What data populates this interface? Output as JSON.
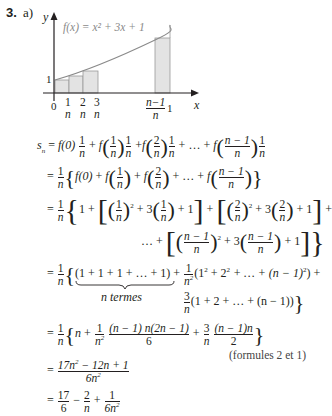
{
  "problem": {
    "number": "3.",
    "part": "a)"
  },
  "graph": {
    "function_label": "f(x) = x² + 3x + 1",
    "y_axis_label": "y",
    "x_axis_label": "x",
    "y_tick": "1",
    "origin_label": "0",
    "x_ticks": [
      {
        "num": "1",
        "den": "n"
      },
      {
        "num": "2",
        "den": "n"
      },
      {
        "num": "3",
        "den": "n"
      },
      {
        "num": "n−1",
        "den": "n"
      }
    ],
    "x_end_label": "1",
    "colors": {
      "curve": "#8a8a8a",
      "rect_fill": "#e3e3e3",
      "rect_stroke": "#9a9a9a",
      "axis": "#231f20"
    }
  },
  "derivation": {
    "lines": [
      {
        "id": "l1",
        "lhs": "s",
        "lhs_sub": "n",
        "text": "= f(0) 1/n + f(1/n) 1/n + f(2/n) 1/n + … + f((n − 1)/n) 1/n"
      },
      {
        "id": "l2",
        "text": "= 1/n { f(0) + f(1/n) + f(2/n) + … + f((n − 1)/n) }"
      },
      {
        "id": "l3",
        "text": "= 1/n { 1 + [ (1/n)² + 3 (1/n) + 1 ] + [ (2/n)² + 3 (2/n) + 1 ] +"
      },
      {
        "id": "l4",
        "text": "… + [ ((n − 1)/n)² + 3 ((n − 1)/n) + 1 ] }"
      },
      {
        "id": "l5",
        "text": "= 1/n { (1 + 1 + 1 + … + 1) + 1/n² (1² + 2² + … + (n − 1)²) +"
      },
      {
        "id": "l5b",
        "text": "n termes"
      },
      {
        "id": "l6",
        "text": "3/n (1 + 2 + … + (n − 1)) }"
      },
      {
        "id": "l7",
        "text": "= 1/n { n + 1/n² (n − 1) n(2n − 1)/6 + 3/n (n − 1)n/2 }"
      },
      {
        "id": "l7note",
        "text": "(formules 2 et 1)"
      },
      {
        "id": "l8",
        "text": "= (17n² − 12n + 1)/(6n²)"
      },
      {
        "id": "l9",
        "text": "= 17/6 − 2/n + 1/(6n²)"
      }
    ],
    "underbrace_label": "n termes",
    "note": "(formules 2 et 1)",
    "tokens": {
      "eq": "=",
      "plus": "+",
      "minus": "−",
      "dots": "…",
      "f": "f",
      "f0": "f(0)",
      "one": "1",
      "two": "2",
      "three": "3",
      "six": "6",
      "n": "n",
      "n2": "n",
      "nm1": "n − 1",
      "three_n": "3",
      "sq": "2",
      "lbrace": "{",
      "rbrace": "}",
      "lbrack": "[",
      "rbrack": "]",
      "lpar": "(",
      "rpar": ")",
      "s": "s",
      "sub_n": "n",
      "ones_sum": "(1 + 1 + 1 + … + 1)",
      "squares_sum_open": "(1",
      "squares_sum_mid": " + 2",
      "squares_sum_end": " + … + (n − 1)",
      "squares_close": ") +",
      "lin_sum": "(1 + 2 + … + (n − 1))",
      "l7_num1": "(n − 1) n(2n − 1)",
      "l7_num2": "(n − 1)n",
      "l8_num": "17n",
      "l8_num_rest": " − 12n + 1",
      "l8_den": "6n",
      "l9_num1": "17",
      "l9_den2": "6n"
    }
  }
}
